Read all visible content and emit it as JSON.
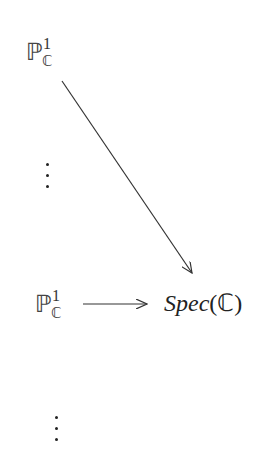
{
  "diagram": {
    "nodes": {
      "top_p1": {
        "base": "ℙ",
        "sup": "1",
        "sub": "ℂ"
      },
      "bottom_p1": {
        "base": "ℙ",
        "sup": "1",
        "sub": "ℂ"
      },
      "spec": {
        "italic": "Spec",
        "rest": "(ℂ)"
      }
    },
    "edges": [
      {
        "from": "top_p1",
        "to": "spec",
        "style": "arrow"
      },
      {
        "from": "bottom_p1",
        "to": "spec",
        "style": "arrow"
      }
    ],
    "ellipses": [
      "vertical-dots-upper",
      "vertical-dots-lower"
    ],
    "colors": {
      "ink": "#222222",
      "background": "#ffffff"
    }
  }
}
